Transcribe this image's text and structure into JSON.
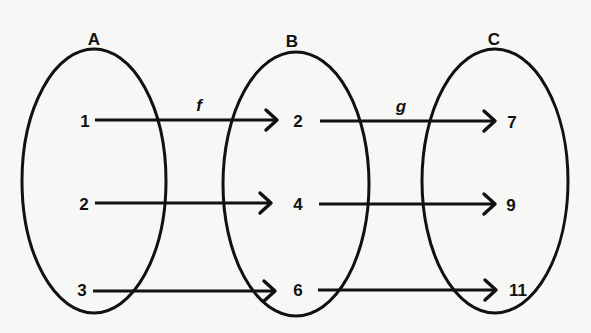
{
  "diagram": {
    "type": "function-composition-mapping",
    "colors": {
      "ink": "#111111",
      "background": "#f7f7f5"
    },
    "sets": [
      {
        "id": "A",
        "label": "A",
        "elements": [
          "1",
          "2",
          "3"
        ]
      },
      {
        "id": "B",
        "label": "B",
        "elements": [
          "2",
          "4",
          "6"
        ]
      },
      {
        "id": "C",
        "label": "C",
        "elements": [
          "7",
          "9",
          "11"
        ]
      }
    ],
    "functions": [
      {
        "id": "f",
        "label": "f",
        "from": "A",
        "to": "B",
        "mappings": [
          [
            "1",
            "2"
          ],
          [
            "2",
            "4"
          ],
          [
            "3",
            "6"
          ]
        ]
      },
      {
        "id": "g",
        "label": "g",
        "from": "B",
        "to": "C",
        "mappings": [
          [
            "2",
            "7"
          ],
          [
            "4",
            "9"
          ],
          [
            "6",
            "11"
          ]
        ]
      }
    ]
  }
}
